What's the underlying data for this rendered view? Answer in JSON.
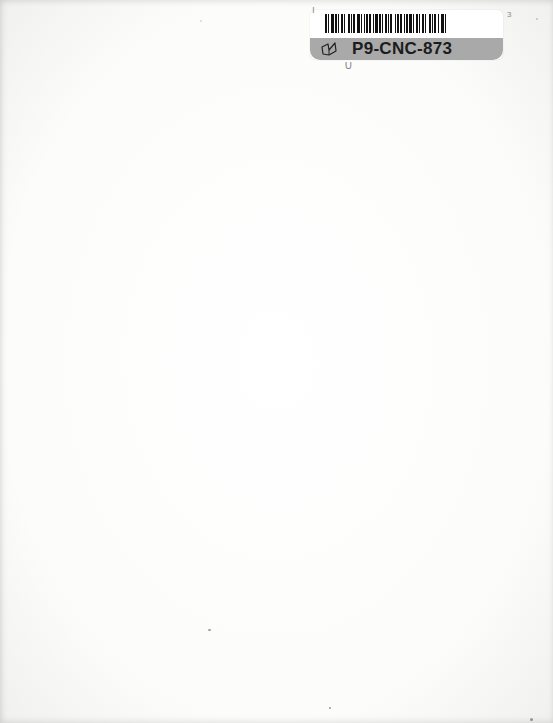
{
  "page": {
    "type": "blank scanned page",
    "background_color": "#fbfbfa"
  },
  "barcode_label": {
    "id_text": "P9-CNC-873",
    "icon": "book-icon",
    "band_color": "#a9a9a9",
    "text_color": "#1c1c1c",
    "bar_pattern": [
      2,
      1,
      1,
      2,
      3,
      1,
      2,
      1,
      1,
      2,
      2,
      1,
      1,
      3,
      2,
      1,
      1,
      1,
      2,
      2,
      3,
      1,
      1,
      2,
      1,
      1,
      2,
      1,
      2,
      2,
      1,
      1,
      3,
      1,
      2,
      1,
      1,
      2,
      2,
      1,
      1,
      1,
      2,
      3,
      1,
      1,
      2,
      1,
      2,
      2,
      1,
      1,
      2,
      1,
      3,
      1,
      1,
      2,
      2,
      1,
      1,
      2,
      2,
      1,
      1,
      3,
      2,
      1,
      1,
      1,
      2,
      2,
      1,
      2,
      3,
      1,
      1,
      2
    ]
  }
}
